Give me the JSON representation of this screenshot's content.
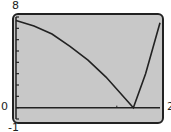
{
  "chart_data": {
    "type": "line",
    "title": "",
    "xlabel": "",
    "ylabel": "",
    "xlim": [
      0,
      2
    ],
    "ylim": [
      -1,
      8
    ],
    "tick_labels": {
      "y_top": "8",
      "y_zero": "0",
      "y_bottom": "-1",
      "x_right": "2"
    },
    "grid": false,
    "series": [
      {
        "name": "f(x)",
        "x": [
          0,
          0.25,
          0.5,
          0.75,
          1.0,
          1.25,
          1.63,
          1.8,
          2.0
        ],
        "y": [
          7.7,
          7.2,
          6.5,
          5.4,
          4.2,
          2.7,
          0.0,
          3.0,
          7.5
        ]
      }
    ],
    "colors": {
      "screen_bg": "#c8c8c8",
      "line": "#222222",
      "frame": "#222222"
    }
  }
}
